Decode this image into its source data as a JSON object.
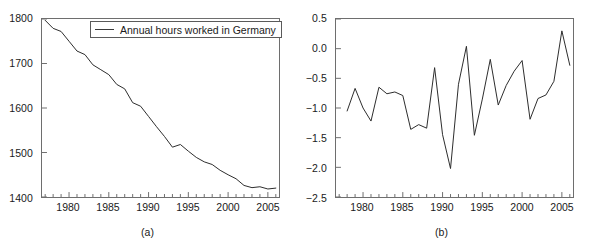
{
  "figure": {
    "width": 589,
    "height": 250,
    "background": "#ffffff",
    "line_color": "#2b2b2b",
    "axis_color": "#6e6e6e"
  },
  "panels": [
    {
      "id": "a",
      "subcaption": "(a)",
      "legend_label": "Annual hours worked in Germany"
    },
    {
      "id": "b",
      "subcaption": "(b)",
      "legend_label": "Percent annual change"
    }
  ],
  "chart_data": [
    {
      "type": "line",
      "panel": "(a)",
      "title": "",
      "xlabel": "",
      "ylabel": "",
      "legend": [
        "Annual hours worked in Germany"
      ],
      "legend_position": "top-center-inside",
      "grid": false,
      "xlim": [
        1976.6,
        2006.4
      ],
      "ylim": [
        1400,
        1800
      ],
      "yticks": [
        1400,
        1500,
        1600,
        1700,
        1800
      ],
      "ytick_labels": [
        "1400",
        "1500",
        "1600",
        "1700",
        "1800"
      ],
      "xticks_major": [
        1980,
        1985,
        1990,
        1995,
        2000,
        2005
      ],
      "xtick_labels": [
        "1980",
        "1985",
        "1990",
        "1995",
        "2000",
        "2005"
      ],
      "xticks_minor_step": 1,
      "x": [
        1977,
        1978,
        1979,
        1980,
        1981,
        1982,
        1983,
        1984,
        1985,
        1986,
        1987,
        1988,
        1989,
        1990,
        1991,
        1992,
        1993,
        1994,
        1995,
        1996,
        1997,
        1998,
        1999,
        2000,
        2001,
        2002,
        2003,
        2004,
        2005,
        2006
      ],
      "values": [
        1797,
        1779,
        1772,
        1750,
        1728,
        1720,
        1697,
        1686,
        1675,
        1653,
        1643,
        1612,
        1604,
        1581,
        1558,
        1536,
        1512,
        1518,
        1503,
        1489,
        1479,
        1473,
        1460,
        1450,
        1441,
        1426,
        1421,
        1423,
        1418,
        1420
      ]
    },
    {
      "type": "line",
      "panel": "(b)",
      "title": "",
      "xlabel": "",
      "ylabel": "",
      "legend": [
        "Percent annual change"
      ],
      "legend_position": "top-left-inside",
      "grid": false,
      "xlim": [
        1976.6,
        2006.4
      ],
      "ylim": [
        -2.5,
        0.5
      ],
      "yticks": [
        -2.5,
        -2.0,
        -1.5,
        -1.0,
        -0.5,
        0.0,
        0.5
      ],
      "ytick_labels": [
        "−2.5",
        "−2.0",
        "−1.5",
        "−1.0",
        "−0.5",
        "0.0",
        "0.5"
      ],
      "xticks_major": [
        1980,
        1985,
        1990,
        1995,
        2000,
        2005
      ],
      "xtick_labels": [
        "1980",
        "1985",
        "1990",
        "1995",
        "2000",
        "2005"
      ],
      "xticks_minor_step": 1,
      "x": [
        1978,
        1979,
        1980,
        1981,
        1982,
        1983,
        1984,
        1985,
        1986,
        1987,
        1988,
        1989,
        1990,
        1991,
        1992,
        1993,
        1994,
        1995,
        1996,
        1997,
        1998,
        1999,
        2000,
        2001,
        2002,
        2003,
        2004,
        2005,
        2006
      ],
      "values": [
        -1.05,
        -0.67,
        -1.0,
        -1.22,
        -0.65,
        -0.76,
        -0.73,
        -0.79,
        -1.36,
        -1.28,
        -1.34,
        -0.32,
        -1.45,
        -2.02,
        -0.6,
        0.04,
        -1.46,
        -0.85,
        -0.18,
        -0.95,
        -0.62,
        -0.38,
        -0.2,
        -1.19,
        -0.84,
        -0.78,
        -0.55,
        0.3,
        -0.28,
        -0.06
      ]
    }
  ]
}
